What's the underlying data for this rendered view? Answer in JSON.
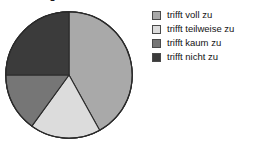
{
  "title_remnant": "Abbildung",
  "legend": {
    "items": [
      {
        "label": "trifft voll zu",
        "color": "#a9a9a9",
        "icon": "color-swatch-icon"
      },
      {
        "label": "trifft teilweise zu",
        "color": "#dcdcdc",
        "icon": "color-swatch-icon"
      },
      {
        "label": "trifft kaum zu",
        "color": "#767676",
        "icon": "color-swatch-icon"
      },
      {
        "label": "trifft nicht zu",
        "color": "#3b3b3b",
        "icon": "color-swatch-icon"
      }
    ]
  },
  "chart_data": {
    "type": "pie",
    "title": "",
    "categories": [
      "trifft voll zu",
      "trifft teilweise zu",
      "trifft kaum zu",
      "trifft nicht zu"
    ],
    "values": [
      42,
      18,
      25,
      15
    ],
    "unit": "%",
    "colors": [
      "#a9a9a9",
      "#dcdcdc",
      "#767676",
      "#3b3b3b"
    ],
    "start_angle_deg": 0,
    "direction": "clockwise",
    "legend_position": "right",
    "grid": false,
    "labels_shown": false,
    "slice_boundaries_deg": [
      0,
      151,
      216,
      270,
      360
    ],
    "center_px": [
      69,
      75
    ],
    "radius_px": 64
  }
}
